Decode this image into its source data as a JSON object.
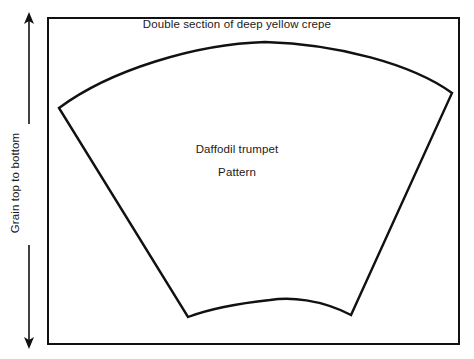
{
  "figure": {
    "type": "sewing-pattern-diagram",
    "background_color": "#ffffff",
    "line_color": "#111111",
    "text_color": "#1a1a1a",
    "captions": {
      "top": "Double section of deep yellow crepe",
      "center_line_1": "Daffodil trumpet",
      "center_line_2": "Pattern",
      "grain_axis": "Grain top to bottom"
    },
    "frame": {
      "left": 47,
      "top": 17,
      "right": 460,
      "bottom": 345,
      "stroke_width": 2
    },
    "grain_arrow": {
      "name": "double-headed-vertical-arrow",
      "x": 29,
      "y_top": 14,
      "y_bottom": 347,
      "heads": "both"
    },
    "pattern_piece": {
      "name": "daffodil-trumpet-fan",
      "vertices": {
        "upper_left": [
          59,
          108
        ],
        "upper_right": [
          452,
          93
        ],
        "lower_right": [
          351,
          315
        ],
        "lower_left": [
          188,
          317
        ]
      },
      "top_arc_apex": [
        265,
        42
      ],
      "bottom_arc_apex": [
        270,
        300
      ],
      "stroke_width": 2.4
    }
  }
}
